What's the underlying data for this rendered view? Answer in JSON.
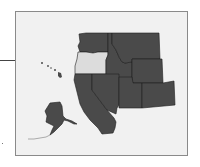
{
  "map": {
    "title": "Western United States region",
    "highlighted_state": "Oregon",
    "colors": {
      "highlight": "#dcdcdc",
      "state_fill": "#4a4a4a",
      "state_border": "#1e1e1e",
      "frame_bg": "#f1f1f1",
      "frame_border": "#8a8a8a"
    },
    "states": [
      {
        "name": "Washington",
        "highlighted": false
      },
      {
        "name": "Oregon",
        "highlighted": true
      },
      {
        "name": "California",
        "highlighted": false
      },
      {
        "name": "Idaho",
        "highlighted": false
      },
      {
        "name": "Nevada",
        "highlighted": false
      },
      {
        "name": "Montana",
        "highlighted": false
      },
      {
        "name": "Wyoming",
        "highlighted": false
      },
      {
        "name": "Utah",
        "highlighted": false
      },
      {
        "name": "Colorado",
        "highlighted": false
      },
      {
        "name": "Alaska",
        "highlighted": false
      },
      {
        "name": "Hawaii",
        "highlighted": false
      }
    ]
  }
}
